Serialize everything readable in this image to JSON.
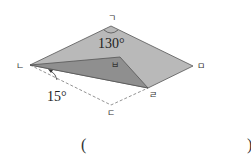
{
  "diagram": {
    "vertices": {
      "giyeok": {
        "label": "ㄱ",
        "x": 111,
        "y": 26
      },
      "nieun": {
        "label": "ㄴ",
        "x": 30,
        "y": 65
      },
      "digeut": {
        "label": "ㄷ",
        "x": 111,
        "y": 105
      },
      "rieul": {
        "label": "ㄹ",
        "x": 148,
        "y": 88
      },
      "mieum": {
        "label": "ㅁ",
        "x": 193,
        "y": 66
      },
      "bieup": {
        "label": "ㅂ",
        "x": 120,
        "y": 57
      }
    },
    "angles": {
      "top": "130°",
      "bottom_left": "15°"
    },
    "colors": {
      "light_face": "#b8b8b8",
      "dark_face": "#8e8e8e",
      "edge": "#555555",
      "dashed": "#777777"
    }
  },
  "answer": {
    "open_paren": "(",
    "close_paren": ")"
  }
}
